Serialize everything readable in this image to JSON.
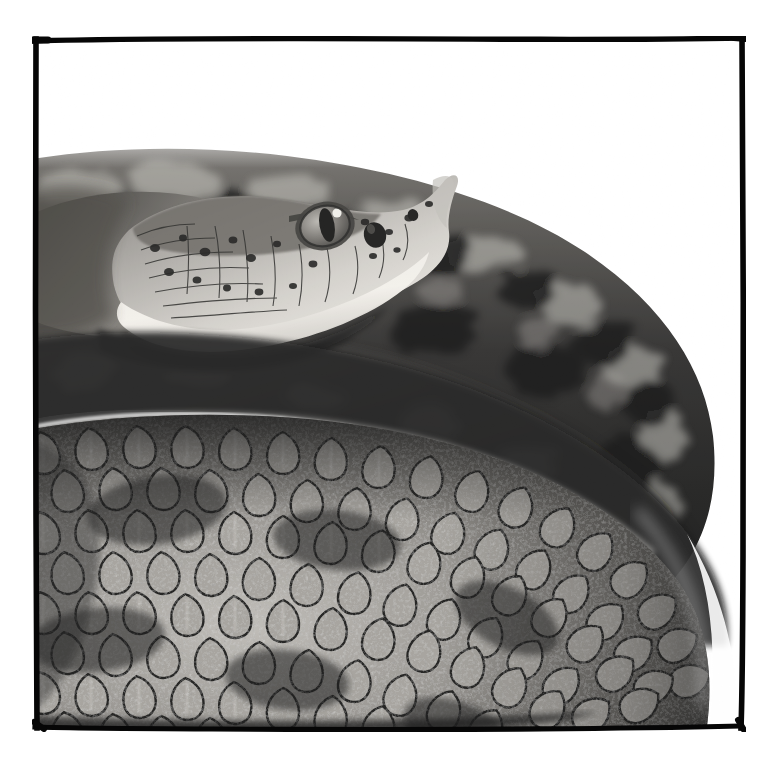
{
  "image": {
    "kind": "photograph",
    "medium": "black-and-white film photograph",
    "subject": "coiled rattlesnake",
    "orientation": "square",
    "presentation": "bordered print with hand-drawn black frame line",
    "background_color": "#ffffff",
    "frame_color": "#050505",
    "tone_range": {
      "highlight": "#ffffff",
      "light_scale": "#d8d5d0",
      "midtone": "#8a8884",
      "shadow": "#2a2a28",
      "black": "#050505"
    }
  },
  "frame": {
    "name": "hand-drawn-border",
    "top_y": 37,
    "left_x": 36,
    "right_x": 744,
    "bottom_y": 729,
    "stroke_px": 5,
    "color": "#060606"
  },
  "subject": {
    "animal": "rattlesnake",
    "pose": "tightly coiled with head raised over the coils",
    "parts": [
      {
        "name": "head",
        "focus": "sharp",
        "bbox": [
          150,
          160,
          300,
          180
        ],
        "features": [
          "eye",
          "vertical-slit-pupil",
          "heat-sensing-pit",
          "nostril",
          "supraocular-scale",
          "labial-scales",
          "chin-shields"
        ]
      },
      {
        "name": "eye",
        "focus": "sharp",
        "center": [
          325,
          223
        ],
        "pupil": "vertical ellipse",
        "catchlight": true
      },
      {
        "name": "loreal-pit",
        "center": [
          375,
          232
        ]
      },
      {
        "name": "nostril",
        "center": [
          413,
          212
        ]
      },
      {
        "name": "upper-background-coil",
        "focus": "out-of-focus",
        "bbox": [
          36,
          150,
          710,
          280
        ],
        "description": "blotched dark band curving from upper left across to the right"
      },
      {
        "name": "foreground-coil",
        "focus": "sharp",
        "bbox": [
          36,
          420,
          700,
          310
        ],
        "description": "large body loop filling the lower two-thirds with keeled diamond scales"
      },
      {
        "name": "coil-right-edge",
        "description": "body loop curves away against bare white ground at the right",
        "apex_x": 700
      }
    ]
  },
  "texture": {
    "scale_shape": "keeled teardrop / diamond",
    "scale_rows": "diagonal overlapping ranks",
    "approx_scale_width_px": 46,
    "approx_scale_height_px": 44,
    "keel_highlight": "#e6e3de",
    "scale_edge": "#0b0b0a",
    "speckle": "fine dark stippling on each scale"
  },
  "composition": {
    "white_margins": {
      "top": 37,
      "left": 36,
      "right": 30,
      "bottom": 34
    },
    "empty_white_areas": [
      "upper-right quadrant above the coils",
      "lower-right corner beside the coil edge"
    ],
    "light_direction": "from upper left",
    "depth_of_field": "shallow — head and lower coil sharp, upper coil blurred"
  }
}
